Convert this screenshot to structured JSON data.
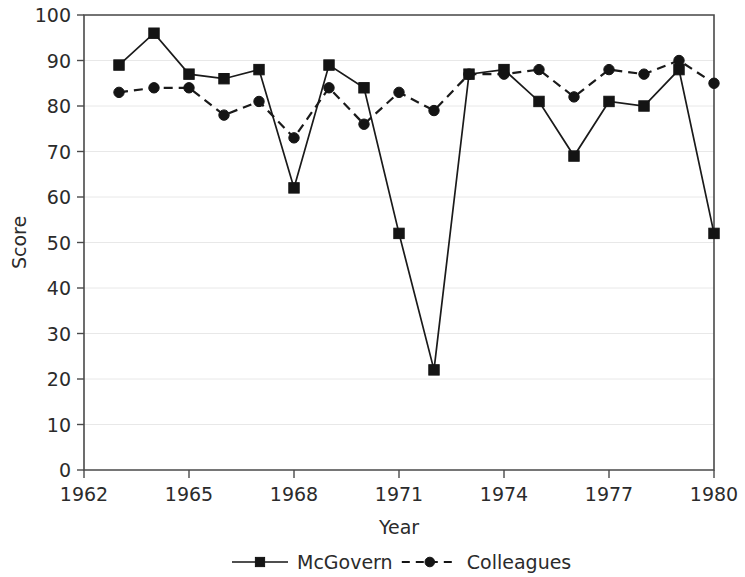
{
  "chart_data": {
    "type": "line",
    "title": "",
    "subtitle": "",
    "xlabel": "Year",
    "ylabel": "Score",
    "xlim": [
      1962,
      1980
    ],
    "ylim": [
      0,
      100
    ],
    "grid": true,
    "legend_position": "bottom",
    "x": [
      1963,
      1964,
      1965,
      1966,
      1967,
      1968,
      1969,
      1970,
      1971,
      1972,
      1973,
      1974,
      1975,
      1976,
      1977,
      1978,
      1979,
      1980
    ],
    "xticks": [
      1962,
      1965,
      1968,
      1971,
      1974,
      1977,
      1980
    ],
    "xtick_labels": [
      "1962",
      "1965",
      "1968",
      "1971",
      "1974",
      "1977",
      "1980"
    ],
    "yticks": [
      0,
      10,
      20,
      30,
      40,
      50,
      60,
      70,
      80,
      90,
      100
    ],
    "ytick_labels": [
      "0",
      "10",
      "20",
      "30",
      "40",
      "50",
      "60",
      "70",
      "80",
      "90",
      "100"
    ],
    "series": [
      {
        "name": "McGovern",
        "marker": "square",
        "linestyle": "solid",
        "color": "#141414",
        "values": [
          89,
          96,
          87,
          86,
          88,
          62,
          89,
          84,
          52,
          22,
          87,
          88,
          81,
          69,
          81,
          80,
          88,
          52
        ]
      },
      {
        "name": "Colleagues",
        "marker": "circle",
        "linestyle": "dashed",
        "color": "#141414",
        "values": [
          83,
          84,
          84,
          78,
          81,
          73,
          84,
          76,
          83,
          79,
          87,
          87,
          88,
          82,
          88,
          87,
          90,
          85
        ]
      }
    ]
  },
  "legend": {
    "entries": [
      {
        "label": "McGovern"
      },
      {
        "label": "Colleagues"
      }
    ]
  },
  "axes": {
    "x_title": "Year",
    "y_title": "Score"
  }
}
